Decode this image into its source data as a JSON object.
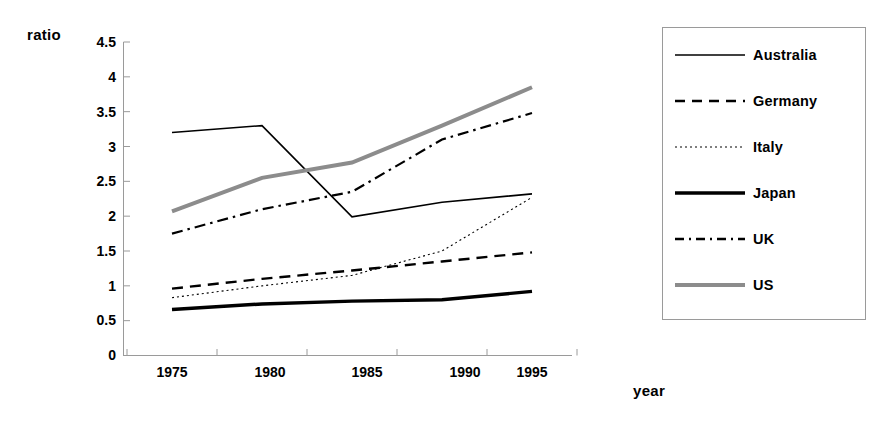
{
  "chart_data": {
    "type": "line",
    "title": "",
    "xlabel": "year",
    "ylabel": "ratio",
    "x": [
      1975,
      1980,
      1985,
      1990,
      1995
    ],
    "xtick_labels": [
      "1975",
      "1980",
      "1985",
      "1990",
      "1995"
    ],
    "ytick_labels": [
      "0",
      "0.5",
      "1",
      "1.5",
      "2",
      "2.5",
      "3",
      "3.5",
      "4",
      "4.5"
    ],
    "ylim": [
      0,
      4.5
    ],
    "ytick_step": 0.5,
    "grid": false,
    "legend_position": "right-outside",
    "series": [
      {
        "name": "Australia",
        "values": [
          3.2,
          3.3,
          1.99,
          2.2,
          2.32
        ],
        "style": "solid",
        "width": 1.6,
        "color": "#000000"
      },
      {
        "name": "Germany",
        "values": [
          0.96,
          1.1,
          1.22,
          1.35,
          1.48
        ],
        "style": "dashed",
        "width": 2.4,
        "color": "#000000"
      },
      {
        "name": "Italy",
        "values": [
          0.83,
          1.0,
          1.15,
          1.5,
          2.27
        ],
        "style": "dotted",
        "width": 1.1,
        "color": "#000000"
      },
      {
        "name": "Japan",
        "values": [
          0.66,
          0.74,
          0.78,
          0.8,
          0.92
        ],
        "style": "solid-thick",
        "width": 3.4,
        "color": "#000000"
      },
      {
        "name": "UK",
        "values": [
          1.75,
          2.1,
          2.35,
          3.1,
          3.48
        ],
        "style": "dash-dot",
        "width": 2.2,
        "color": "#000000"
      },
      {
        "name": "US",
        "values": [
          2.07,
          2.55,
          2.77,
          3.3,
          3.85
        ],
        "style": "solid-thick-gray",
        "width": 4.0,
        "color": "#8c8c8c"
      }
    ]
  },
  "legend": {
    "items": [
      {
        "label": "Australia"
      },
      {
        "label": "Germany"
      },
      {
        "label": "Italy"
      },
      {
        "label": "Japan"
      },
      {
        "label": "UK"
      },
      {
        "label": "US"
      }
    ]
  },
  "colors": {
    "axis": "#9a9a9a",
    "line_black": "#000000",
    "line_gray": "#8c8c8c",
    "legend_border": "#9a9a9a",
    "background": "#ffffff"
  }
}
